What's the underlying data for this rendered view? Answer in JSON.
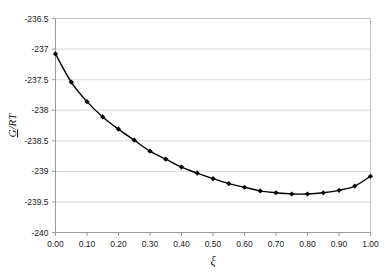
{
  "chart_data": {
    "type": "line",
    "title": "",
    "xlabel": "ξ",
    "ylabel": "G/RT",
    "xlim": [
      0.0,
      1.0
    ],
    "ylim": [
      -240.0,
      -236.5
    ],
    "grid": true,
    "legend": false,
    "marker": "diamond",
    "line_color": "#000000",
    "marker_color": "#000000",
    "grid_color": "#d9d9d9",
    "axis_color": "#b0b0b0",
    "plot_background": "#ffffff",
    "xticks": [
      "0.00",
      "0.10",
      "0.20",
      "0.30",
      "0.40",
      "0.50",
      "0.60",
      "0.70",
      "0.80",
      "0.90",
      "1.00"
    ],
    "xtick_values": [
      0.0,
      0.1,
      0.2,
      0.3,
      0.4,
      0.5,
      0.6,
      0.7,
      0.8,
      0.9,
      1.0
    ],
    "yticks": [
      "-236.5",
      "-237",
      "-237.5",
      "-238",
      "-238.5",
      "-239",
      "-239.5",
      "-240"
    ],
    "ytick_values": [
      -236.5,
      -237.0,
      -237.5,
      -238.0,
      -238.5,
      -239.0,
      -239.5,
      -240.0
    ],
    "x": [
      0.0,
      0.05,
      0.1,
      0.15,
      0.2,
      0.25,
      0.3,
      0.35,
      0.4,
      0.45,
      0.5,
      0.55,
      0.6,
      0.65,
      0.7,
      0.75,
      0.8,
      0.85,
      0.9,
      0.95,
      1.0
    ],
    "values": [
      -237.08,
      -237.54,
      -237.86,
      -238.11,
      -238.31,
      -238.49,
      -238.67,
      -238.8,
      -238.93,
      -239.03,
      -239.12,
      -239.2,
      -239.26,
      -239.32,
      -239.35,
      -239.37,
      -239.37,
      -239.35,
      -239.31,
      -239.24,
      -239.08
    ],
    "series": [
      {
        "name": "G/RT",
        "values": [
          -237.08,
          -237.54,
          -237.86,
          -238.11,
          -238.31,
          -238.49,
          -238.67,
          -238.8,
          -238.93,
          -239.03,
          -239.12,
          -239.2,
          -239.26,
          -239.32,
          -239.35,
          -239.37,
          -239.37,
          -239.35,
          -239.31,
          -239.24,
          -239.08
        ]
      }
    ]
  }
}
